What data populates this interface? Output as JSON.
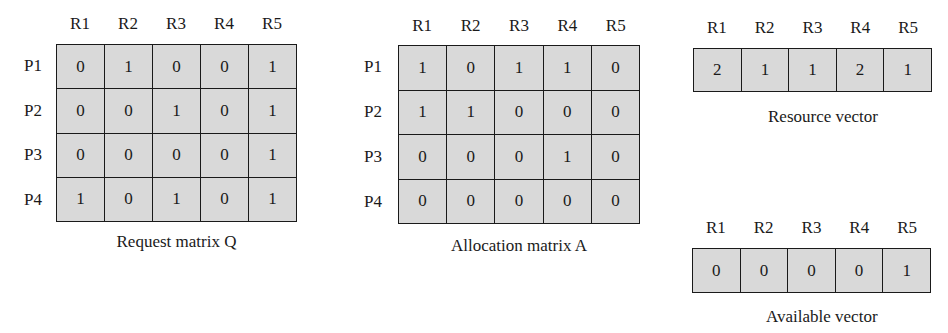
{
  "resources": [
    "R1",
    "R2",
    "R3",
    "R4",
    "R5"
  ],
  "processes": [
    "P1",
    "P2",
    "P3",
    "P4"
  ],
  "request_matrix": {
    "caption": "Request matrix Q",
    "rows": [
      [
        "0",
        "1",
        "0",
        "0",
        "1"
      ],
      [
        "0",
        "0",
        "1",
        "0",
        "1"
      ],
      [
        "0",
        "0",
        "0",
        "0",
        "1"
      ],
      [
        "1",
        "0",
        "1",
        "0",
        "1"
      ]
    ]
  },
  "allocation_matrix": {
    "caption": "Allocation matrix A",
    "rows": [
      [
        "1",
        "0",
        "1",
        "1",
        "0"
      ],
      [
        "1",
        "1",
        "0",
        "0",
        "0"
      ],
      [
        "0",
        "0",
        "0",
        "1",
        "0"
      ],
      [
        "0",
        "0",
        "0",
        "0",
        "0"
      ]
    ]
  },
  "resource_vector": {
    "caption": "Resource vector",
    "values": [
      "2",
      "1",
      "1",
      "2",
      "1"
    ]
  },
  "available_vector": {
    "caption": "Available vector",
    "values": [
      "0",
      "0",
      "0",
      "0",
      "1"
    ]
  },
  "colors": {
    "cell_fill": "#d9d9d9",
    "border": "#1a1a1a"
  }
}
